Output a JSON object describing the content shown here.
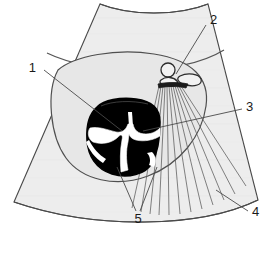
{
  "figure": {
    "type": "annotated-line-diagram",
    "width": 272,
    "height": 253,
    "background_color": "#ffffff"
  },
  "colors": {
    "sector_fill": "#ededed",
    "sector_stroke": "#4a4a4a",
    "inner_field_fill": "#e7e7e7",
    "bone_fill": "#000000",
    "bone_stroke": "#000000",
    "echo_white": "#ffffff",
    "shadow_ray_stroke": "#555555",
    "leader_stroke": "#4a4a4a",
    "label_text": "#1a1a1a"
  },
  "labels": [
    {
      "id": "1",
      "text": "1",
      "x": 36,
      "y": 72,
      "anchor": "end",
      "leader": [
        [
          44,
          70
        ],
        [
          122,
          131
        ]
      ]
    },
    {
      "id": "2",
      "text": "2",
      "x": 210,
      "y": 24,
      "anchor": "start",
      "leader": [
        [
          206,
          25
        ],
        [
          176,
          74
        ]
      ]
    },
    {
      "id": "3",
      "text": "3",
      "x": 246,
      "y": 111,
      "anchor": "start",
      "leader": [
        [
          242,
          109
        ],
        [
          143,
          131
        ]
      ]
    },
    {
      "id": "4",
      "text": "4",
      "x": 252,
      "y": 216,
      "anchor": "start",
      "leader": [
        [
          248,
          211
        ],
        [
          216,
          190
        ]
      ]
    },
    {
      "id": "5",
      "text": "5",
      "x": 138,
      "y": 223,
      "anchor": "middle",
      "leader_a": [
        [
          136,
          211
        ],
        [
          117,
          167
        ]
      ],
      "leader_b": [
        [
          140,
          211
        ],
        [
          157,
          167
        ]
      ]
    }
  ],
  "structures": [
    {
      "name": "sector-field",
      "label": "ultrasound sector field"
    },
    {
      "name": "transducer-face",
      "label": "curved near-field transducer face"
    },
    {
      "name": "uterine-outline",
      "label": "outer soft-tissue arc"
    },
    {
      "name": "gestational-sac",
      "label": "inner rounded sac outline"
    },
    {
      "name": "vertebral-body",
      "label": "hyperechoic vertebra cross-section"
    },
    {
      "name": "spinal-canal-echo",
      "label": "bright central canal echo complex"
    },
    {
      "name": "rib-echo-pair",
      "label": "small bright echo pair (label 2)"
    },
    {
      "name": "acoustic-shadow-fan",
      "label": "acoustic shadow ray fan"
    },
    {
      "name": "far-field-boundary",
      "label": "far-field sector boundary arc (label 4)"
    }
  ]
}
